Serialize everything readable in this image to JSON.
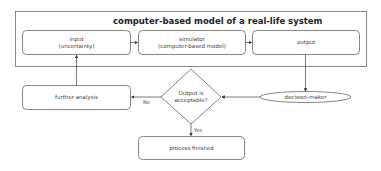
{
  "diagram": {
    "container": {
      "title": "computer-based model of a real-life system"
    },
    "nodes": {
      "input": {
        "line1": "input",
        "line2": "(uncertainty)"
      },
      "simulator": {
        "line1": "simulator",
        "line2": "(computer-based model)"
      },
      "output": {
        "label": "output"
      },
      "decision_maker": {
        "label": "decision-maker"
      },
      "decision": {
        "line1": "Output is",
        "line2": "acceptable?"
      },
      "further_analysis": {
        "label": "further analysis"
      },
      "process_finished": {
        "label": "process finished"
      }
    },
    "edges": {
      "no_label": "No",
      "yes_label": "Yes"
    },
    "colors": {
      "stroke": "#555555",
      "background": "#ffffff",
      "text": "#333333"
    }
  }
}
